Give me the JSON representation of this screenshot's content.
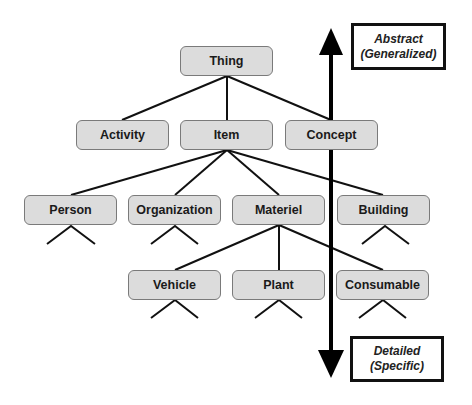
{
  "diagram": {
    "type": "taxonomy-hierarchy",
    "nodes": {
      "thing": "Thing",
      "activity": "Activity",
      "item": "Item",
      "concept": "Concept",
      "person": "Person",
      "organization": "Organization",
      "materiel": "Materiel",
      "building": "Building",
      "vehicle": "Vehicle",
      "plant": "Plant",
      "consumable": "Consumable"
    },
    "edges": [
      [
        "Thing",
        "Activity"
      ],
      [
        "Thing",
        "Item"
      ],
      [
        "Thing",
        "Concept"
      ],
      [
        "Item",
        "Person"
      ],
      [
        "Item",
        "Organization"
      ],
      [
        "Item",
        "Materiel"
      ],
      [
        "Item",
        "Building"
      ],
      [
        "Materiel",
        "Vehicle"
      ],
      [
        "Materiel",
        "Plant"
      ],
      [
        "Materiel",
        "Consumable"
      ]
    ],
    "axis": {
      "top": {
        "line1": "Abstract",
        "line2": "(Generalized)"
      },
      "bottom": {
        "line1": "Detailed",
        "line2": "(Specific)"
      }
    }
  }
}
